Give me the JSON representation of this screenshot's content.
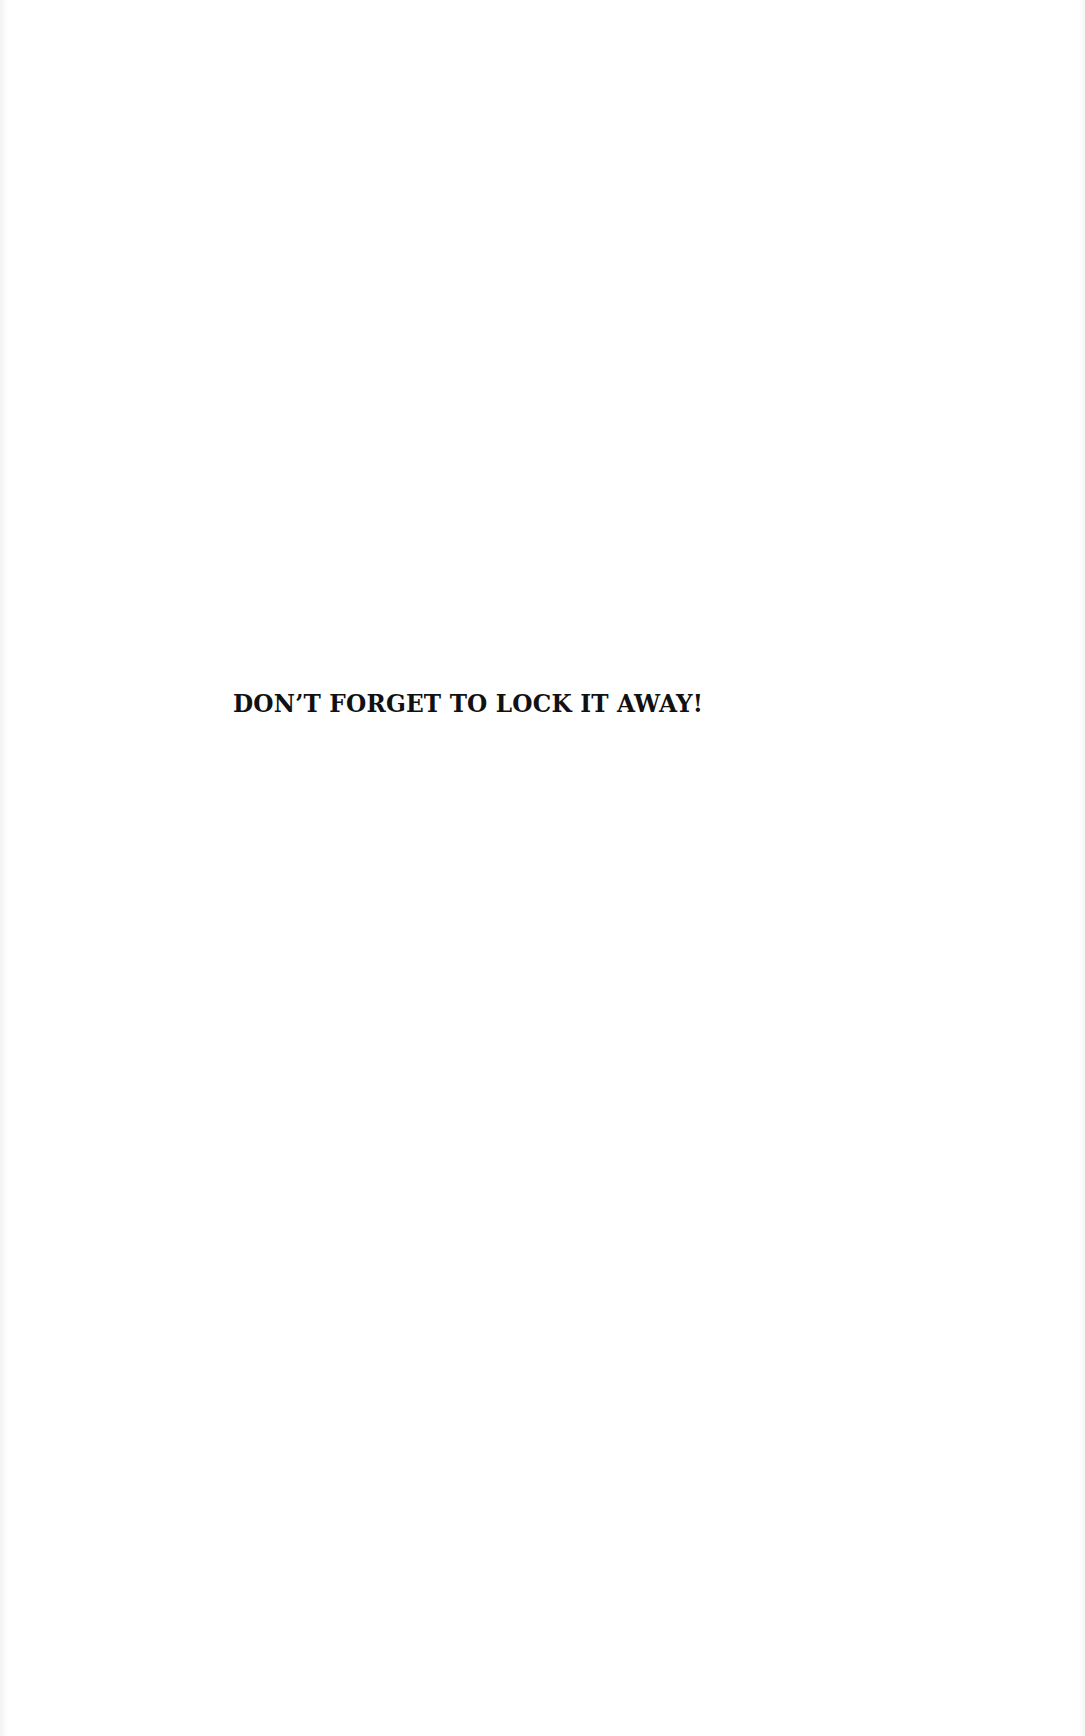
{
  "page": {
    "headline": "DON’T FORGET TO LOCK IT AWAY!",
    "background_color": "#ffffff",
    "text_color": "#111111"
  }
}
